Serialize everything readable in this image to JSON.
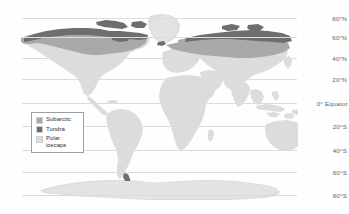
{
  "map": {
    "title": "World climate zones map",
    "projection": "equirectangular",
    "background_color": "#fefefe",
    "gridline_color": "#d9dde0",
    "latitude_labels": [
      {
        "label": "80°N",
        "value": 80,
        "y": 18
      },
      {
        "label": "60°N",
        "value": 60,
        "y": 37
      },
      {
        "label": "40°N",
        "value": 40,
        "y": 58
      },
      {
        "label": "20°N",
        "value": 20,
        "y": 79
      },
      {
        "label": "0°  Equator",
        "value": 0,
        "y": 103
      },
      {
        "label": "20°S",
        "value": -20,
        "y": 126
      },
      {
        "label": "40°S",
        "value": -40,
        "y": 150
      },
      {
        "label": "60°S",
        "value": -60,
        "y": 172
      },
      {
        "label": "80°S",
        "value": -80,
        "y": 195
      }
    ],
    "land_color": "#dcdcdc",
    "zones": {
      "subarctic_color": "#a9a9a9",
      "tundra_color": "#6e6e6e",
      "polar_icecaps_color": "#dcdcdc"
    }
  },
  "legend": {
    "border_color": "#9aa0a4",
    "items": [
      {
        "label": "Subarctic",
        "color": "#a9a9a9"
      },
      {
        "label": "Tundra",
        "color": "#6e6e6e"
      },
      {
        "label": "Polar\nicecaps",
        "color": "#dcdcdc"
      }
    ]
  }
}
